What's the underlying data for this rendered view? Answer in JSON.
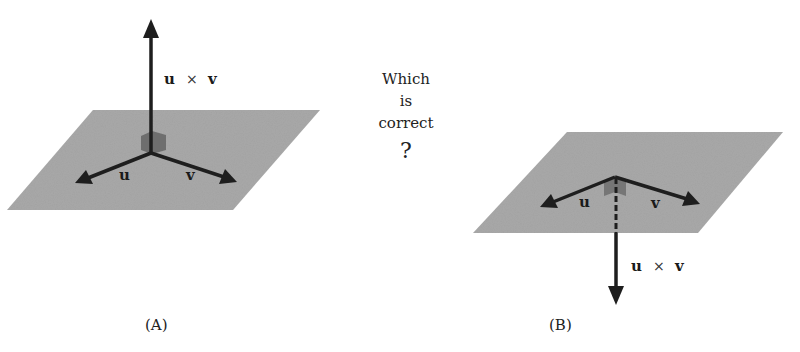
{
  "question": {
    "line1": "Which",
    "line2": "is",
    "line3": "correct",
    "mark": "?"
  },
  "figure_a": {
    "caption": "(A)",
    "u_label": "u",
    "v_label": "v",
    "cross_label": {
      "u": "u",
      "op": "×",
      "v": "v"
    },
    "cross_direction": "up"
  },
  "figure_b": {
    "caption": "(B)",
    "u_label": "u",
    "v_label": "v",
    "cross_label": {
      "u": "u",
      "op": "×",
      "v": "v"
    },
    "cross_direction": "down"
  },
  "colors": {
    "plane": "#a3a3a3",
    "vector": "#1e1e1e",
    "right_angle_marker": "#6e6e6e"
  }
}
